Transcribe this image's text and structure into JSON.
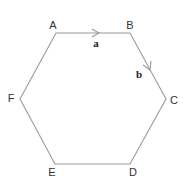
{
  "diagram": {
    "type": "regular hexagon",
    "stroke_color": "#9a9a9a",
    "vertices": [
      {
        "label": "A",
        "x": 56,
        "y": 33,
        "lx": 53,
        "ly": 29
      },
      {
        "label": "B",
        "x": 130,
        "y": 33,
        "lx": 130,
        "ly": 29
      },
      {
        "label": "C",
        "x": 166,
        "y": 99,
        "lx": 174,
        "ly": 104
      },
      {
        "label": "D",
        "x": 130,
        "y": 164,
        "lx": 133,
        "ly": 176
      },
      {
        "label": "E",
        "x": 55,
        "y": 164,
        "lx": 52,
        "ly": 176
      },
      {
        "label": "F",
        "x": 20,
        "y": 99,
        "lx": 11,
        "ly": 102
      }
    ],
    "vectors": [
      {
        "label": "a",
        "from": "A",
        "to": "B",
        "lx": 95,
        "ly": 47
      },
      {
        "label": "b",
        "from": "B",
        "to": "C",
        "lx": 139,
        "ly": 77
      }
    ]
  }
}
